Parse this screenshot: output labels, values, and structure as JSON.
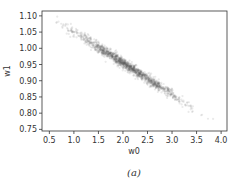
{
  "chart_data": {
    "type": "scatter",
    "title": "",
    "xlabel": "w0",
    "ylabel": "w1",
    "xlim": [
      0.35,
      4.12
    ],
    "ylim": [
      0.745,
      1.115
    ],
    "xticks": [
      0.5,
      1.0,
      1.5,
      2.0,
      2.5,
      3.0,
      3.5,
      4.0
    ],
    "yticks": [
      0.75,
      0.8,
      0.85,
      0.9,
      0.95,
      1.0,
      1.05,
      1.1
    ],
    "xtick_labels": [
      "0.5",
      "1.0",
      "1.5",
      "2.0",
      "2.5",
      "3.0",
      "3.5",
      "4.0"
    ],
    "ytick_labels": [
      "0.75",
      "0.80",
      "0.85",
      "0.90",
      "0.95",
      "1.00",
      "1.05",
      "1.10"
    ],
    "grid": false,
    "legend": null,
    "series": [
      {
        "name": "samples",
        "description": "Dense narrow band of semi-transparent gray points along a negatively sloped line",
        "trend_line": {
          "x": [
            0.6,
            4.0
          ],
          "y": [
            1.09,
            0.76
          ]
        },
        "density_peak": {
          "x": 2.1,
          "y": 0.94
        },
        "color": "#555555"
      }
    ],
    "caption": "(a)"
  }
}
